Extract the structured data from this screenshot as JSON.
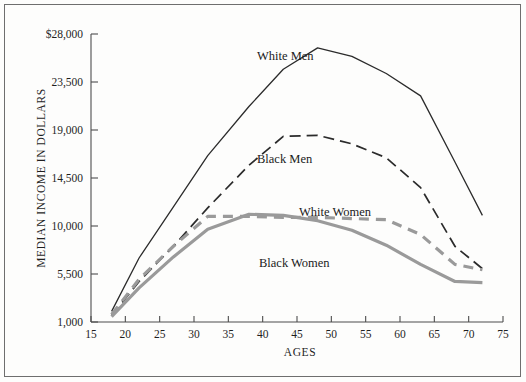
{
  "figure": {
    "background": "#fdfdfc",
    "frame_color": "#6e6e6e"
  },
  "axes": {
    "y_title": "MEDIAN INCOME IN DOLLARS",
    "x_title": "AGES",
    "y_ticks": [
      "$28,000",
      "23,500",
      "19,000",
      "14,500",
      "10,000",
      "5,500",
      "1,000"
    ],
    "x_ticks": [
      "15",
      "20",
      "25",
      "30",
      "35",
      "40",
      "45",
      "50",
      "55",
      "60",
      "65",
      "70",
      "75"
    ]
  },
  "labels": {
    "white_men": "White Men",
    "black_men": "Black Men",
    "white_women": "White Women",
    "black_women": "Black Women"
  },
  "colors": {
    "men_black": "#2b2b2b",
    "women_gray": "#9a9a9a",
    "axis": "#4d4d4d",
    "text": "#1f1f1f"
  },
  "chart_data": {
    "type": "line",
    "title": "",
    "xlabel": "AGES",
    "ylabel": "MEDIAN INCOME IN DOLLARS",
    "xlim": [
      15,
      75
    ],
    "ylim": [
      1000,
      28000
    ],
    "ytick_values": [
      28000,
      23500,
      19000,
      14500,
      10000,
      5500,
      1000
    ],
    "xtick_values": [
      15,
      20,
      25,
      30,
      35,
      40,
      45,
      50,
      55,
      60,
      65,
      70,
      75
    ],
    "grid": false,
    "legend": "inline-labels",
    "series": [
      {
        "name": "White Men",
        "color": "#2b2b2b",
        "style": "solid",
        "x": [
          18,
          22,
          27,
          32,
          38,
          43,
          48,
          53,
          58,
          63,
          68,
          72
        ],
        "values": [
          2000,
          7000,
          11800,
          16600,
          21200,
          24700,
          26700,
          25900,
          24300,
          22200,
          16000,
          11000
        ]
      },
      {
        "name": "Black Men",
        "color": "#2b2b2b",
        "style": "dashed",
        "x": [
          18,
          22,
          27,
          32,
          38,
          43,
          48,
          53,
          58,
          63,
          68,
          72
        ],
        "values": [
          1600,
          4800,
          8100,
          11700,
          15700,
          18400,
          18500,
          17700,
          16400,
          13600,
          8100,
          6000
        ]
      },
      {
        "name": "White Women",
        "color": "#9a9a9a",
        "style": "dashed",
        "x": [
          18,
          22,
          27,
          32,
          38,
          43,
          48,
          53,
          58,
          63,
          68,
          72
        ],
        "values": [
          1700,
          5000,
          8100,
          10900,
          10900,
          10800,
          10800,
          10700,
          10600,
          9200,
          6400,
          5900
        ]
      },
      {
        "name": "Black Women",
        "color": "#9a9a9a",
        "style": "solid",
        "x": [
          18,
          22,
          27,
          32,
          38,
          43,
          48,
          53,
          58,
          63,
          68,
          72
        ],
        "values": [
          1500,
          4200,
          7100,
          9700,
          11100,
          11000,
          10500,
          9600,
          8200,
          6400,
          4800,
          4700
        ]
      }
    ]
  }
}
